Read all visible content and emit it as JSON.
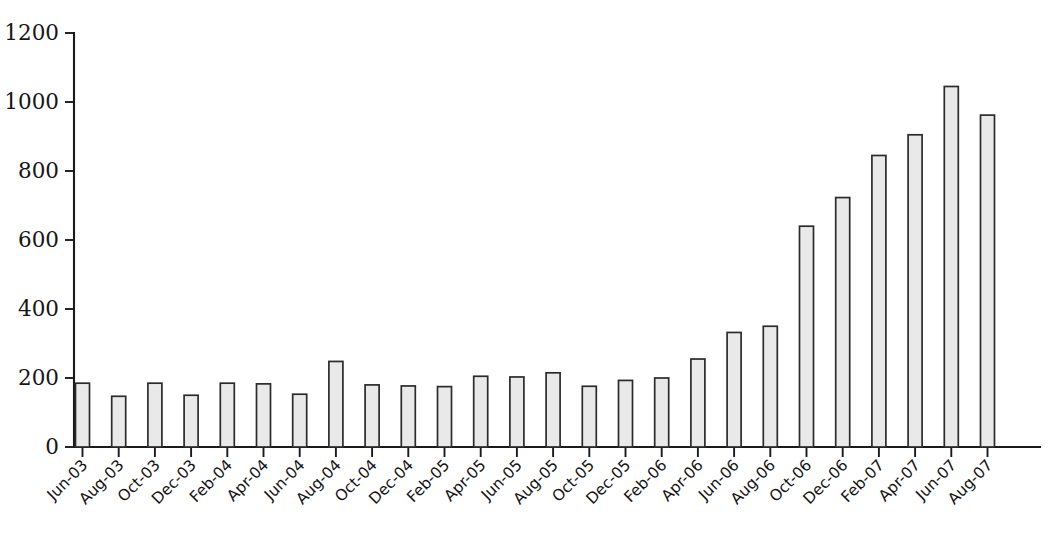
{
  "chart_data": {
    "type": "bar",
    "title": "",
    "subtitle": "",
    "xlabel": "",
    "ylabel": "",
    "ylim": [
      0,
      1200
    ],
    "yticks": [
      0,
      200,
      400,
      600,
      800,
      1000,
      1200
    ],
    "ytick_labels": [
      "0",
      "200",
      "400",
      "600",
      "800",
      "1000",
      "1200"
    ],
    "grid": false,
    "legend": null,
    "legend_position": "none",
    "bar_fill_color": "#e9e9e9",
    "bar_edge_color": "#2b2b2b",
    "axis_color": "#1a1a1a",
    "background_color": "#ffffff",
    "categories": [
      "Jun-03",
      "Aug-03",
      "Oct-03",
      "Dec-03",
      "Feb-04",
      "Apr-04",
      "Jun-04",
      "Aug-04",
      "Oct-04",
      "Dec-04",
      "Feb-05",
      "Apr-05",
      "Jun-05",
      "Aug-05",
      "Oct-05",
      "Dec-05",
      "Feb-06",
      "Apr-06",
      "Jun-06",
      "Aug-06",
      "Oct-06",
      "Dec-06",
      "Feb-07",
      "Apr-07",
      "Jun-07",
      "Aug-07"
    ],
    "values": [
      185,
      147,
      185,
      150,
      185,
      183,
      153,
      248,
      180,
      177,
      175,
      205,
      203,
      215,
      176,
      193,
      200,
      255,
      332,
      350,
      640,
      723,
      845,
      905,
      1045,
      962
    ]
  },
  "axes": {
    "y_axis_name": "y-axis",
    "x_axis_name": "x-axis"
  }
}
